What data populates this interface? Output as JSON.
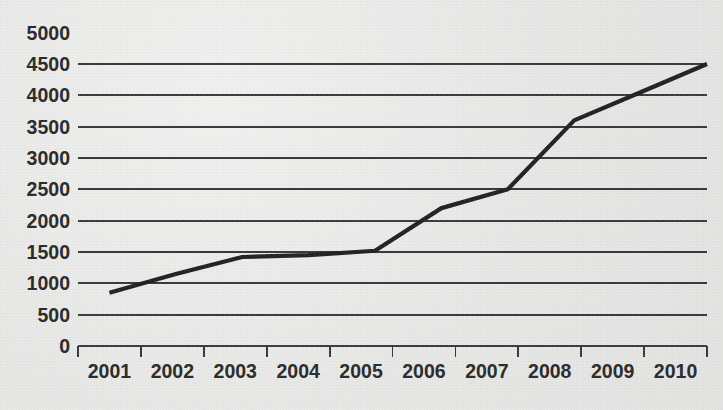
{
  "chart_data": {
    "type": "line",
    "title": "",
    "subtitle": "",
    "xlabel": "",
    "ylabel": "",
    "categories": [
      "2001",
      "2002",
      "2003",
      "2004",
      "2005",
      "2006",
      "2007",
      "2008",
      "2009",
      "2010"
    ],
    "x": [
      2001,
      2002,
      2003,
      2004,
      2005,
      2006,
      2007,
      2008,
      2009,
      2010
    ],
    "values": [
      850,
      1150,
      1420,
      1450,
      1520,
      2200,
      2500,
      3600,
      4050,
      4500
    ],
    "series": [
      {
        "name": "",
        "values": [
          850,
          1150,
          1420,
          1450,
          1520,
          2200,
          2500,
          3600,
          4050,
          4500
        ]
      }
    ],
    "ylim": [
      0,
      5000
    ],
    "y_ticks": [
      0,
      500,
      1000,
      1500,
      2000,
      2500,
      3000,
      3500,
      4000,
      4500,
      5000
    ],
    "y_tick_labels": [
      "0",
      "500",
      "1000",
      "1500",
      "2000",
      "2500",
      "3000",
      "3500",
      "4000",
      "4500",
      "5000"
    ],
    "gridlines": [
      0,
      500,
      1000,
      1500,
      2000,
      2500,
      3000,
      3500,
      4000,
      4500
    ],
    "grid": true,
    "grid_axis": "y",
    "legend": false,
    "legend_position": "none",
    "markers": false,
    "annotations": [],
    "colors": {
      "line": "#232323",
      "grid": "#3a3a3a",
      "axis": "#3a3a3a",
      "text": "#2b2b2b",
      "background": "#eaeae9"
    }
  },
  "axes": {
    "y_axis_name": "y-axis",
    "x_axis_name": "x-axis"
  }
}
